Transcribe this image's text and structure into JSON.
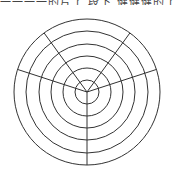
{
  "header": {
    "cropped_text": "一一一一的片了 段下 健健健的了 一"
  },
  "diagram": {
    "type": "polar-grid",
    "center": [
      87,
      92
    ],
    "ring_radii": [
      12,
      24,
      36,
      48,
      61,
      73
    ],
    "spoke_angles_deg": [
      90,
      198,
      342,
      234,
      306
    ],
    "stroke": "#333333"
  }
}
